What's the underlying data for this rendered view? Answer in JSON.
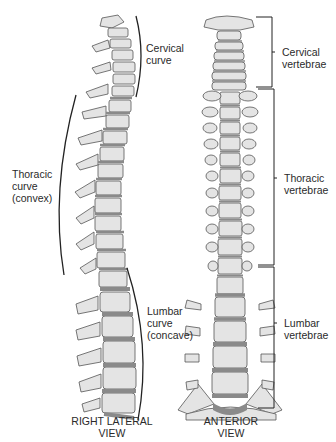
{
  "figure": {
    "lateral_view": {
      "caption": [
        "RIGHT LATERAL",
        "VIEW"
      ],
      "curves": [
        {
          "name": "cervical",
          "lines": [
            "Cervical",
            "curve"
          ]
        },
        {
          "name": "thoracic",
          "lines": [
            "Thoracic",
            "curve",
            "(convex)"
          ]
        },
        {
          "name": "lumbar",
          "lines": [
            "Lumbar",
            "curve",
            "(concave)"
          ]
        }
      ]
    },
    "anterior_view": {
      "caption": [
        "ANTERIOR",
        "VIEW"
      ],
      "regions": [
        {
          "name": "cervical",
          "lines": [
            "Cervical",
            "vertebrae"
          ]
        },
        {
          "name": "thoracic",
          "lines": [
            "Thoracic",
            "vertebrae"
          ]
        },
        {
          "name": "lumbar",
          "lines": [
            "Lumbar",
            "vertebrae"
          ]
        }
      ]
    },
    "colors": {
      "bone_fill": "#e4e4e4",
      "bone_outline": "#555555",
      "disc": "#8a8a8a",
      "line": "#222222"
    }
  }
}
